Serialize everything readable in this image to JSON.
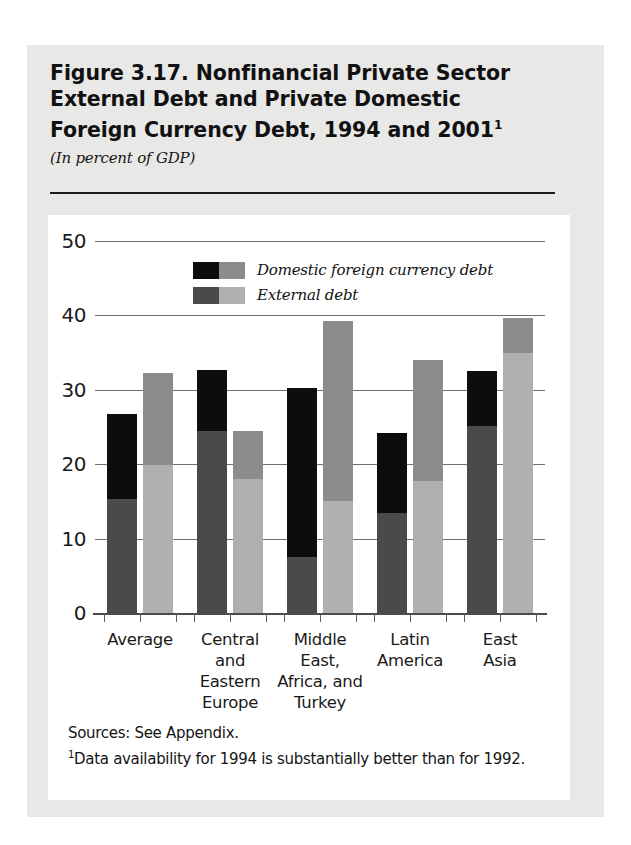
{
  "figure": {
    "title_line1": "Figure 3.17. Nonfinancial Private Sector",
    "title_line2": "External Debt and Private Domestic",
    "title_line3": "Foreign Currency Debt, 1994 and 2001",
    "title_footnote_marker": "1",
    "subtitle": "(In percent of GDP)"
  },
  "footnotes": {
    "sources": "Sources: See Appendix.",
    "note_marker": "1",
    "note_text": "Data availability for 1994 is substantially better than for 1992."
  },
  "colors": {
    "page_background": "#e8e8e6",
    "card_background": "#ffffff",
    "bar_1994_domestic": "#0d0d0d",
    "bar_1994_external": "#4a4a4a",
    "bar_2001_domestic": "#8c8c8c",
    "bar_2001_external": "#b0b0b0",
    "gridline": "#6f6f6f",
    "text": "#111111"
  },
  "chart_data": {
    "type": "bar",
    "title": "Figure 3.17. Nonfinancial Private Sector External Debt and Private Domestic Foreign Currency Debt, 1994 and 2001",
    "subtitle": "(In percent of GDP)",
    "xlabel": "",
    "ylabel": "In percent of GDP",
    "ylim": [
      0,
      50
    ],
    "yticks": [
      0,
      10,
      20,
      30,
      40,
      50
    ],
    "ytick_labels": [
      "0",
      "10",
      "20",
      "30",
      "40",
      "50"
    ],
    "grid": true,
    "stacked": true,
    "legend_position": "top-left-inside",
    "legend": [
      {
        "label": "Domestic foreign currency debt",
        "swatch_1994": "#0d0d0d",
        "swatch_2001": "#8c8c8c"
      },
      {
        "label": "External debt",
        "swatch_1994": "#4a4a4a",
        "swatch_2001": "#b0b0b0"
      }
    ],
    "categories": [
      "Average",
      "Central and Eastern Europe",
      "Middle East, Africa, and Turkey",
      "Latin America",
      "East Asia"
    ],
    "category_label_lines": [
      [
        "Average"
      ],
      [
        "Central",
        "and",
        "Eastern",
        "Europe"
      ],
      [
        "Middle",
        "East,",
        "Africa, and",
        "Turkey"
      ],
      [
        "Latin",
        "America"
      ],
      [
        "East",
        "Asia"
      ]
    ],
    "series": [
      {
        "name": "1994",
        "segments": [
          {
            "name": "External debt",
            "values": [
              15.3,
              24.5,
              7.5,
              13.5,
              25.2
            ]
          },
          {
            "name": "Domestic foreign currency debt",
            "values": [
              11.5,
              8.2,
              22.7,
              10.7,
              7.3
            ]
          }
        ],
        "totals": [
          26.8,
          32.7,
          30.2,
          24.2,
          32.5
        ]
      },
      {
        "name": "2001",
        "segments": [
          {
            "name": "External debt",
            "values": [
              19.9,
              18.0,
              15.0,
              17.8,
              35.0
            ]
          },
          {
            "name": "Domestic foreign currency debt",
            "values": [
              12.4,
              6.4,
              24.3,
              16.2,
              4.6
            ]
          }
        ],
        "totals": [
          32.3,
          24.4,
          39.3,
          34.0,
          39.6
        ]
      }
    ]
  }
}
